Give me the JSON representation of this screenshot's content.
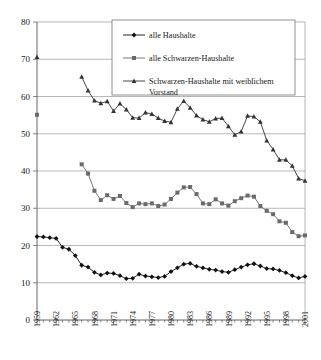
{
  "chart_data": {
    "type": "line",
    "title": "",
    "xlabel": "",
    "ylabel": "",
    "ylim": [
      0,
      80
    ],
    "ytick_step": 10,
    "yticks": [
      "0",
      "10",
      "20",
      "30",
      "40",
      "50",
      "60",
      "70",
      "80"
    ],
    "xlim": [
      1959,
      2001
    ],
    "xticks": [
      "1959",
      "1962",
      "1965",
      "1968",
      "1971",
      "1974",
      "1977",
      "1980",
      "1983",
      "1986",
      "1989",
      "1992",
      "1995",
      "1998",
      "2001"
    ],
    "xtick_step": 3,
    "grid": "horizontal",
    "legend_position": "top-center-inside",
    "colors": {
      "alle_haushalte": "#111111",
      "alle_schwarzen_haushalte": "#6a6a6a",
      "schwarzen_weiblich": "#333333",
      "gridline": "#9a9a9a",
      "axis": "#555555",
      "background": "#ffffff"
    },
    "markers": {
      "alle_haushalte": "diamond",
      "alle_schwarzen_haushalte": "square",
      "schwarzen_weiblich": "triangle"
    },
    "series": [
      {
        "name": "alle Haushalte",
        "marker": "diamond",
        "color": "#111111",
        "x": [
          1959,
          1960,
          1961,
          1962,
          1963,
          1964,
          1965,
          1966,
          1967,
          1968,
          1969,
          1970,
          1971,
          1972,
          1973,
          1974,
          1975,
          1976,
          1977,
          1978,
          1979,
          1980,
          1981,
          1982,
          1983,
          1984,
          1985,
          1986,
          1987,
          1988,
          1989,
          1990,
          1991,
          1992,
          1993,
          1994,
          1995,
          1996,
          1997,
          1998,
          1999,
          2000,
          2001
        ],
        "values": [
          22.4,
          22.3,
          22.1,
          21.9,
          19.5,
          19.0,
          17.3,
          14.7,
          14.2,
          12.8,
          12.1,
          12.6,
          12.5,
          11.9,
          11.1,
          11.2,
          12.3,
          11.8,
          11.6,
          11.4,
          11.7,
          13.0,
          14.0,
          15.0,
          15.2,
          14.4,
          14.0,
          13.6,
          13.4,
          13.0,
          12.8,
          13.5,
          14.2,
          14.8,
          15.1,
          14.5,
          13.8,
          13.7,
          13.3,
          12.7,
          11.9,
          11.3,
          11.7
        ]
      },
      {
        "name": "alle Schwarzen-Haushalte",
        "marker": "square",
        "color": "#6a6a6a",
        "x": [
          1959,
          1966,
          1967,
          1968,
          1969,
          1970,
          1971,
          1972,
          1973,
          1974,
          1975,
          1976,
          1977,
          1978,
          1979,
          1980,
          1981,
          1982,
          1983,
          1984,
          1985,
          1986,
          1987,
          1988,
          1989,
          1990,
          1991,
          1992,
          1993,
          1994,
          1995,
          1996,
          1997,
          1998,
          1999,
          2000,
          2001
        ],
        "values": [
          55.1,
          41.8,
          39.3,
          34.7,
          32.2,
          33.5,
          32.5,
          33.3,
          31.4,
          30.3,
          31.3,
          31.1,
          31.3,
          30.6,
          31.0,
          32.5,
          34.2,
          35.6,
          35.7,
          33.8,
          31.3,
          31.1,
          32.4,
          31.3,
          30.7,
          31.9,
          32.7,
          33.4,
          33.1,
          30.6,
          29.3,
          28.4,
          26.5,
          26.1,
          23.6,
          22.5,
          22.7
        ]
      },
      {
        "name": "Schwarzen-Haushalte mit weiblichem Vorstand",
        "marker": "triangle",
        "color": "#333333",
        "x": [
          1959,
          1966,
          1967,
          1968,
          1969,
          1970,
          1971,
          1972,
          1973,
          1974,
          1975,
          1976,
          1977,
          1978,
          1979,
          1980,
          1981,
          1982,
          1983,
          1984,
          1985,
          1986,
          1987,
          1988,
          1989,
          1990,
          1991,
          1992,
          1993,
          1994,
          1995,
          1996,
          1997,
          1998,
          1999,
          2000,
          2001
        ],
        "values": [
          70.6,
          65.3,
          61.6,
          58.9,
          58.2,
          58.7,
          56.1,
          58.1,
          56.5,
          54.3,
          54.2,
          55.7,
          55.3,
          54.2,
          53.4,
          53.1,
          56.7,
          58.8,
          57.0,
          54.9,
          53.8,
          53.2,
          54.1,
          54.2,
          52.0,
          49.7,
          50.6,
          54.8,
          54.6,
          53.2,
          48.2,
          45.8,
          43.0,
          43.0,
          41.4,
          38.0,
          37.4
        ]
      }
    ]
  },
  "legend": {
    "items": [
      {
        "label": "alle Haushalte",
        "marker": "diamond"
      },
      {
        "label": "alle Schwarzen-Haushalte",
        "marker": "square"
      },
      {
        "label": "Schwarzen-Haushalte mit weiblichem",
        "marker": "triangle"
      },
      {
        "label": "Vorstand",
        "marker": "none"
      }
    ]
  }
}
